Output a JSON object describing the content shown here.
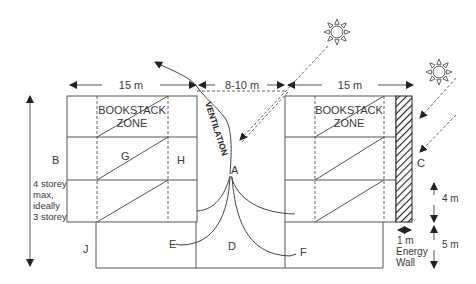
{
  "diagram": {
    "dimensions": {
      "left_width": "15 m",
      "gap_width": "8-10 m",
      "right_width": "15 m",
      "wall_width": "1 m",
      "upper_storey": "4 m",
      "lower_storey": "5 m"
    },
    "zones": {
      "left": [
        "BOOKSTACK",
        "ZONE"
      ],
      "right": [
        "BOOKSTACK",
        "ZONE"
      ]
    },
    "ventilation_label": "VENTILATION",
    "storey_note": [
      "4 storey",
      "max,",
      "ideally",
      "3 storey"
    ],
    "energy_wall_label": [
      "Energy",
      "Wall"
    ],
    "point_labels": {
      "A": "A",
      "B": "B",
      "C": "C",
      "D": "D",
      "E": "E",
      "F": "F",
      "G": "G",
      "H": "H",
      "J": "J"
    },
    "icons": [
      "sun-icon",
      "sun-icon"
    ]
  }
}
